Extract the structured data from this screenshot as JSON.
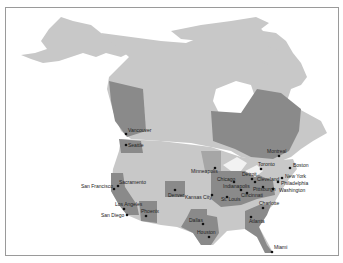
{
  "map": {
    "title": "",
    "region": "North America (Canada, United States)",
    "colors": {
      "background": "#ffffff",
      "land_light": "#c8c8c8",
      "region_highlight": "#8a8a8a",
      "region_mid": "#a6a6a6",
      "border": "#9a9a9a",
      "city_marker": "#111111"
    },
    "cities": [
      {
        "name": "Vancouver",
        "x": 125,
        "y": 133
      },
      {
        "name": "Seattle",
        "x": 125,
        "y": 144
      },
      {
        "name": "San Francisco",
        "x": 113,
        "y": 188
      },
      {
        "name": "Sacramento",
        "x": 117,
        "y": 185
      },
      {
        "name": "Los Angeles",
        "x": 123,
        "y": 208
      },
      {
        "name": "San Diego",
        "x": 126,
        "y": 214
      },
      {
        "name": "Phoenix",
        "x": 145,
        "y": 215
      },
      {
        "name": "Denver",
        "x": 174,
        "y": 189
      },
      {
        "name": "Kansas City",
        "x": 211,
        "y": 194
      },
      {
        "name": "St. Louis",
        "x": 226,
        "y": 196
      },
      {
        "name": "Minneapolis",
        "x": 214,
        "y": 167
      },
      {
        "name": "Chicago",
        "x": 233,
        "y": 181
      },
      {
        "name": "Detroit",
        "x": 251,
        "y": 178
      },
      {
        "name": "Toronto",
        "x": 260,
        "y": 168
      },
      {
        "name": "Cleveland",
        "x": 254,
        "y": 181
      },
      {
        "name": "Pittsburgh",
        "x": 262,
        "y": 186
      },
      {
        "name": "Indianapolis",
        "x": 240,
        "y": 189
      },
      {
        "name": "Cincinnati",
        "x": 246,
        "y": 192
      },
      {
        "name": "Montreal",
        "x": 278,
        "y": 155
      },
      {
        "name": "Boston",
        "x": 289,
        "y": 167
      },
      {
        "name": "New York",
        "x": 281,
        "y": 177
      },
      {
        "name": "Philadelphia",
        "x": 277,
        "y": 181
      },
      {
        "name": "Washington",
        "x": 272,
        "y": 188
      },
      {
        "name": "Charlotte",
        "x": 262,
        "y": 207
      },
      {
        "name": "Atlanta",
        "x": 250,
        "y": 216
      },
      {
        "name": "Dallas",
        "x": 202,
        "y": 223
      },
      {
        "name": "Houston",
        "x": 208,
        "y": 236
      },
      {
        "name": "Miami",
        "x": 271,
        "y": 251
      }
    ]
  }
}
